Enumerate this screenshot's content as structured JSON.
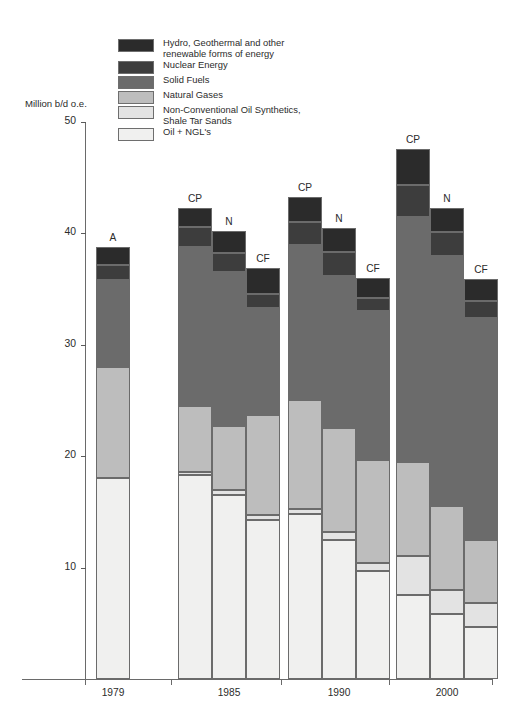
{
  "axes": {
    "y_title": "Million b/d o.e.",
    "y_ticks": [
      "50",
      "40",
      "30",
      "20",
      "10"
    ],
    "x_ticks": [
      "1979",
      "1985",
      "1990",
      "2000"
    ]
  },
  "legend": {
    "items": [
      {
        "label": "Hydro, Geothermal and other\nrenewable forms of energy",
        "color": "#2b2b2b",
        "key": "hydro"
      },
      {
        "label": "Nuclear Energy",
        "color": "#3d3d3d",
        "key": "nuclear"
      },
      {
        "label": "Solid Fuels",
        "color": "#6b6b6b",
        "key": "solid"
      },
      {
        "label": "Natural Gases",
        "color": "#bdbdbd",
        "key": "gas"
      },
      {
        "label": "Non-Conventional Oil Synthetics,\nShale Tar Sands",
        "color": "#e3e3e3",
        "key": "nonconv"
      },
      {
        "label": "Oil + NGL's",
        "color": "#f0f0ef",
        "key": "oil"
      }
    ]
  },
  "chart_data": {
    "type": "bar",
    "subtype": "stacked",
    "title": "",
    "xlabel": "",
    "ylabel": "Million b/d o.e.",
    "ylim": [
      0,
      50
    ],
    "ytick_values": [
      50,
      40,
      30,
      20,
      10
    ],
    "grid": false,
    "legend_position": "top-left",
    "categories": [
      "1979",
      "1985",
      "1990",
      "2000"
    ],
    "scenario_names": [
      "A",
      "CP",
      "N",
      "CF"
    ],
    "series": [
      {
        "name": "Oil + NGL's",
        "key": "oil",
        "color": "#f0f0ef"
      },
      {
        "name": "Non-Conventional Oil Synthetics, Shale Tar Sands",
        "key": "nonconv",
        "color": "#e3e3e3"
      },
      {
        "name": "Natural Gases",
        "key": "gas",
        "color": "#bdbdbd"
      },
      {
        "name": "Solid Fuels",
        "key": "solid",
        "color": "#6b6b6b"
      },
      {
        "name": "Nuclear Energy",
        "key": "nuclear",
        "color": "#3d3d3d"
      },
      {
        "name": "Hydro, Geothermal and other renewable forms of energy",
        "key": "hydro",
        "color": "#2b2b2b"
      }
    ],
    "bars": [
      {
        "group": "1979",
        "scenario": "A",
        "total": 38.8,
        "values": {
          "oil": 18.0,
          "nonconv": 0.0,
          "gas": 10.0,
          "solid": 7.8,
          "nuclear": 1.4,
          "hydro": 1.6
        }
      },
      {
        "group": "1985",
        "scenario": "CP",
        "total": 42.3,
        "values": {
          "oil": 18.3,
          "nonconv": 0.3,
          "gas": 5.9,
          "solid": 14.3,
          "nuclear": 1.8,
          "hydro": 1.7
        }
      },
      {
        "group": "1985",
        "scenario": "N",
        "total": 40.2,
        "values": {
          "oil": 16.5,
          "nonconv": 0.5,
          "gas": 5.7,
          "solid": 13.8,
          "nuclear": 1.7,
          "hydro": 2.0
        }
      },
      {
        "group": "1985",
        "scenario": "CF",
        "total": 36.9,
        "values": {
          "oil": 14.3,
          "nonconv": 0.4,
          "gas": 9.0,
          "solid": 9.6,
          "nuclear": 1.3,
          "hydro": 2.3
        }
      },
      {
        "group": "1990",
        "scenario": "CP",
        "total": 43.3,
        "values": {
          "oil": 14.8,
          "nonconv": 0.5,
          "gas": 9.7,
          "solid": 14.0,
          "nuclear": 2.0,
          "hydro": 2.3
        }
      },
      {
        "group": "1990",
        "scenario": "N",
        "total": 40.5,
        "values": {
          "oil": 12.5,
          "nonconv": 0.7,
          "gas": 9.3,
          "solid": 13.7,
          "nuclear": 2.1,
          "hydro": 2.2
        }
      },
      {
        "group": "1990",
        "scenario": "CF",
        "total": 36.0,
        "values": {
          "oil": 9.7,
          "nonconv": 0.7,
          "gas": 9.3,
          "solid": 13.3,
          "nuclear": 1.2,
          "hydro": 1.8
        }
      },
      {
        "group": "2000",
        "scenario": "CP",
        "total": 47.6,
        "values": {
          "oil": 7.5,
          "nonconv": 3.5,
          "gas": 8.5,
          "solid": 22.0,
          "nuclear": 2.8,
          "hydro": 3.3
        }
      },
      {
        "group": "2000",
        "scenario": "N",
        "total": 42.3,
        "values": {
          "oil": 5.8,
          "nonconv": 2.2,
          "gas": 7.5,
          "solid": 22.5,
          "nuclear": 2.1,
          "hydro": 2.2
        }
      },
      {
        "group": "2000",
        "scenario": "CF",
        "total": 35.9,
        "values": {
          "oil": 4.7,
          "nonconv": 2.1,
          "gas": 5.7,
          "solid": 19.9,
          "nuclear": 1.5,
          "hydro": 2.0
        }
      }
    ],
    "layout": {
      "baseline_y": 679,
      "top_y": 122,
      "top_value": 50,
      "bar_width": 34,
      "bar_x": [
        96,
        178,
        212,
        246,
        288,
        322,
        356,
        396,
        430,
        464
      ]
    }
  }
}
